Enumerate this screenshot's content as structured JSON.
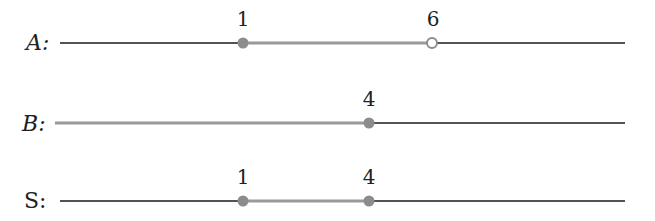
{
  "colors": {
    "base_line": "#1a1a1a",
    "highlight": "#9a9a9a",
    "point": "#8c8c8c",
    "background": "#ffffff"
  },
  "rows": [
    {
      "name": "A",
      "label": "A:",
      "label_style": "italic",
      "segments": [
        {
          "from_px": 60,
          "to_px": 243,
          "type": "base"
        },
        {
          "from_px": 243,
          "to_px": 432,
          "type": "highlight"
        },
        {
          "from_px": 432,
          "to_px": 625,
          "type": "base"
        }
      ],
      "points": [
        {
          "value": "1",
          "x_px": 243,
          "filled": true
        },
        {
          "value": "6",
          "x_px": 432,
          "filled": false
        }
      ]
    },
    {
      "name": "B",
      "label": "B:",
      "label_style": "italic",
      "segments": [
        {
          "from_px": 55,
          "to_px": 369,
          "type": "highlight"
        },
        {
          "from_px": 369,
          "to_px": 625,
          "type": "base"
        }
      ],
      "points": [
        {
          "value": "4",
          "x_px": 369,
          "filled": true
        }
      ]
    },
    {
      "name": "S",
      "label": "S:",
      "label_style": "normal",
      "segments": [
        {
          "from_px": 60,
          "to_px": 243,
          "type": "base"
        },
        {
          "from_px": 243,
          "to_px": 369,
          "type": "highlight"
        },
        {
          "from_px": 369,
          "to_px": 625,
          "type": "base"
        }
      ],
      "points": [
        {
          "value": "1",
          "x_px": 243,
          "filled": true
        },
        {
          "value": "4",
          "x_px": 369,
          "filled": true
        }
      ]
    }
  ],
  "text": {
    "row_a_label": "A:",
    "row_a_point_1": "1",
    "row_a_point_2": "6",
    "row_b_label": "B:",
    "row_b_point_1": "4",
    "row_s_label": "S:",
    "row_s_point_1": "1",
    "row_s_point_2": "4"
  }
}
